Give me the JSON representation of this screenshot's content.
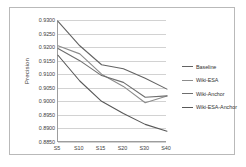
{
  "chart_data": {
    "type": "line",
    "title": "",
    "xlabel": "",
    "ylabel": "Precision",
    "categories": [
      "S5",
      "S10",
      "S15",
      "S20",
      "S30",
      "S40"
    ],
    "ylim": [
      0.885,
      0.93
    ],
    "yticks": [
      "0.9300",
      "0.9250",
      "0.9200",
      "0.9150",
      "0.9100",
      "0.9050",
      "0.9000",
      "0.8950",
      "0.8900",
      "0.8850"
    ],
    "ytick_values": [
      0.93,
      0.925,
      0.92,
      0.915,
      0.91,
      0.905,
      0.9,
      0.895,
      0.89,
      0.885
    ],
    "grid": true,
    "legend_position": "right",
    "series": [
      {
        "name": "Baseline",
        "color": "#636363",
        "values": [
          0.9295,
          0.9205,
          0.9135,
          0.912,
          0.9085,
          0.9045
        ]
      },
      {
        "name": "Wiki-ESA",
        "color": "#8c8c8c",
        "values": [
          0.9205,
          0.9175,
          0.91,
          0.9055,
          0.8995,
          0.902
        ]
      },
      {
        "name": "Wiki-Anchor",
        "color": "#6e6e6e",
        "values": [
          0.9195,
          0.915,
          0.9095,
          0.907,
          0.9015,
          0.902
        ]
      },
      {
        "name": "Wiki-ESA-Anchor",
        "color": "#585858",
        "values": [
          0.917,
          0.9075,
          0.9,
          0.8955,
          0.8915,
          0.889
        ]
      }
    ]
  },
  "legend": {
    "items": [
      {
        "label": "Baseline"
      },
      {
        "label": "Wiki-ESA"
      },
      {
        "label": "Wiki-Anchor"
      },
      {
        "label": "Wiki-ESA-Anchor"
      }
    ]
  }
}
